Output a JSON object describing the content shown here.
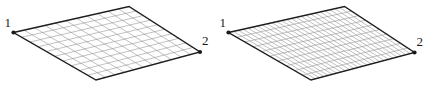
{
  "figure": {
    "title": "",
    "background_color": "#ffffff",
    "panel_count": 2
  },
  "style": {
    "outline_color": "#1d1d1d",
    "grid_color": "#8d8d8d",
    "vertex_marker_color": "#1a1a1a",
    "label_color": "#1a1a1a",
    "outline_width": 1.4,
    "grid_width": 0.55,
    "vertex_marker_radius": 2.1,
    "label_font_size": 13
  },
  "panels": [
    {
      "id": "left",
      "name": "coarse-mesh-panel",
      "quad": {
        "v1": {
          "x": 13.5,
          "y": 32.5,
          "label": "1"
        },
        "v_top": {
          "x": 129.0,
          "y": 6.5
        },
        "v2": {
          "x": 200.0,
          "y": 52.0,
          "label": "2"
        },
        "v_bottom": {
          "x": 96.0,
          "y": 80.0
        }
      },
      "grid": {
        "u_divisions": 11,
        "v_divisions": 10
      },
      "labels": [
        {
          "text": "1",
          "x": 11.0,
          "y": 26.5,
          "anchor": "end",
          "name": "vertex-label-1"
        },
        {
          "text": "2",
          "x": 202.0,
          "y": 45.0,
          "anchor": "start",
          "name": "vertex-label-2"
        }
      ]
    },
    {
      "id": "right",
      "name": "fine-mesh-panel",
      "quad": {
        "v1": {
          "x": 13.5,
          "y": 32.5,
          "label": "1"
        },
        "v_top": {
          "x": 129.5,
          "y": 6.5
        },
        "v2": {
          "x": 199.5,
          "y": 52.5,
          "label": "2"
        },
        "v_bottom": {
          "x": 96.0,
          "y": 80.0
        }
      },
      "grid": {
        "u_divisions": 24,
        "v_divisions": 10
      },
      "labels": [
        {
          "text": "1",
          "x": 11.0,
          "y": 26.5,
          "anchor": "end",
          "name": "vertex-label-1"
        },
        {
          "text": "2",
          "x": 201.5,
          "y": 45.5,
          "anchor": "start",
          "name": "vertex-label-2"
        }
      ]
    }
  ]
}
